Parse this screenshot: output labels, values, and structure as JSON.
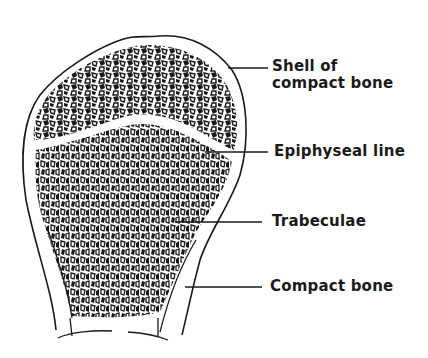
{
  "figure": {
    "colors": {
      "ink": "#1a1a1a",
      "background": "#ffffff"
    }
  },
  "labels": [
    {
      "id": "shell",
      "line1": "Shell of",
      "line2": "compact bone"
    },
    {
      "id": "epiphyseal",
      "line1": "Epiphyseal line"
    },
    {
      "id": "trabeculae",
      "line1": "Trabeculae"
    },
    {
      "id": "compact",
      "line1": "Compact bone"
    }
  ]
}
